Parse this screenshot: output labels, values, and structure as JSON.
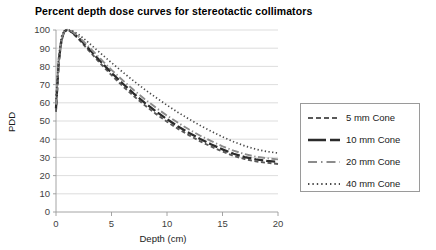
{
  "chart_data": {
    "type": "line",
    "title": "Percent depth dose curves for stereotactic collimators",
    "xlabel": "Depth (cm)",
    "ylabel": "PDD",
    "xlim": [
      0,
      20
    ],
    "ylim": [
      0,
      100
    ],
    "xticks": [
      0,
      5,
      10,
      15,
      20
    ],
    "yticks": [
      0,
      10,
      20,
      30,
      40,
      50,
      60,
      70,
      80,
      90,
      100
    ],
    "grid": "horizontal",
    "legend_position": "right-outside",
    "x": [
      0,
      0.25,
      0.5,
      0.75,
      1.0,
      1.25,
      1.5,
      2,
      2.5,
      3,
      4,
      5,
      6,
      7,
      8,
      9,
      10,
      11,
      12,
      13,
      14,
      15,
      16,
      17,
      18,
      19,
      20
    ],
    "series": [
      {
        "name": "5 mm Cone",
        "dash": "dashed",
        "color": "#595959",
        "values": [
          55,
          82,
          94,
          99,
          100,
          99.4,
          98.2,
          95.2,
          91.8,
          88.4,
          81.6,
          75.2,
          69.2,
          63.7,
          58.6,
          53.9,
          49.6,
          45.7,
          42.1,
          38.8,
          35.9,
          33.2,
          30.8,
          29.1,
          27.8,
          27.0,
          26.4
        ]
      },
      {
        "name": "10 mm Cone",
        "dash": "longdash",
        "color": "#2b2b2b",
        "values": [
          57,
          83,
          95,
          99.3,
          100,
          99.6,
          98.6,
          95.9,
          92.7,
          89.4,
          82.8,
          76.5,
          70.6,
          65.1,
          60.0,
          55.3,
          51.0,
          47.0,
          43.4,
          40.1,
          37.1,
          34.4,
          32.0,
          30.2,
          28.9,
          28.1,
          27.6
        ]
      },
      {
        "name": "20 mm Cone",
        "dash": "dashdot",
        "color": "#8c8c8c",
        "values": [
          59,
          84,
          95.5,
          99.5,
          100,
          99.8,
          99.0,
          96.6,
          93.6,
          90.5,
          84.2,
          78.1,
          72.4,
          67.0,
          62.0,
          57.3,
          53.0,
          49.0,
          45.3,
          41.9,
          38.9,
          36.1,
          33.7,
          31.8,
          30.4,
          29.5,
          28.9
        ]
      },
      {
        "name": "40 mm Cone",
        "dash": "dotted",
        "color": "#4a4a4a",
        "values": [
          62,
          86,
          96.5,
          99.8,
          100,
          100,
          99.5,
          97.7,
          95.3,
          92.7,
          87.3,
          82.0,
          76.9,
          72.0,
          67.3,
          62.9,
          58.7,
          54.7,
          51.0,
          47.5,
          44.3,
          41.3,
          38.6,
          36.3,
          34.5,
          33.2,
          32.4
        ]
      }
    ]
  },
  "legend": {
    "items": [
      {
        "label": "5 mm Cone"
      },
      {
        "label": "10 mm Cone"
      },
      {
        "label": "20 mm Cone"
      },
      {
        "label": "40 mm Cone"
      }
    ]
  }
}
